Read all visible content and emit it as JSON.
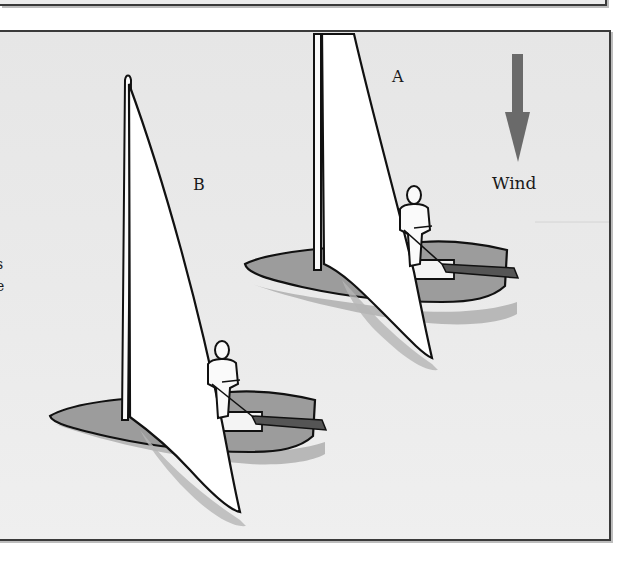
{
  "figure": {
    "labels": {
      "boat_a": "A",
      "boat_b": "B",
      "wind": "Wind"
    },
    "cut_off_left_text": [
      "s",
      "e"
    ],
    "icons": {
      "wind_arrow": "arrow-down-icon"
    },
    "colors": {
      "water": "#e8e8e8",
      "hull": "#9a9a9a",
      "hull_shadow": "#b5b5b5",
      "sail": "#ffffff",
      "outline": "#111111",
      "wind_arrow": "#6a6a6a",
      "frame": "#3a3a3a"
    },
    "boats": [
      {
        "id": "A",
        "position": "upper-right"
      },
      {
        "id": "B",
        "position": "lower-left"
      }
    ]
  }
}
